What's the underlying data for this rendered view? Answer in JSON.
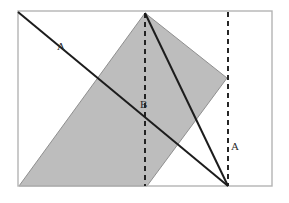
{
  "figure": {
    "canvas": {
      "width": 289,
      "height": 203
    },
    "colors": {
      "background": "#ffffff",
      "frame_stroke": "#b4b4b4",
      "shaded_fill": "#b9b9b9",
      "shaded_stroke": "#8f8f8f",
      "solid_line": "#1c1c1c",
      "dashed_line": "#1c1c1c",
      "label_text": "#2b2b2b"
    },
    "frame": {
      "name": "outer-rectangle",
      "x": 18,
      "y": 11,
      "width": 254,
      "height": 175,
      "stroke_width": 1.4
    },
    "shaded_region": {
      "name": "shaded-parallelogram",
      "points": "145,13 227,78 147,186 19,186",
      "fill_opacity": 0.95,
      "stroke_width": 1.0
    },
    "solid_lines": [
      {
        "name": "diagonal-line-a",
        "x1": 18,
        "y1": 12,
        "x2": 228,
        "y2": 186,
        "stroke_width": 2.0
      },
      {
        "name": "diagonal-line-apex",
        "x1": 145,
        "y1": 13,
        "x2": 228,
        "y2": 186,
        "stroke_width": 2.0
      }
    ],
    "dashed_lines": [
      {
        "name": "dashed-vertical-b",
        "x1": 145,
        "y1": 13,
        "x2": 145,
        "y2": 186,
        "stroke_width": 1.9,
        "dash_pattern": "5,4"
      },
      {
        "name": "dashed-vertical-a",
        "x1": 228,
        "y1": 12,
        "x2": 228,
        "y2": 186,
        "stroke_width": 1.9,
        "dash_pattern": "5,4"
      }
    ],
    "labels": [
      {
        "name": "label-a-upper-left",
        "text": "A",
        "x": 57,
        "y": 50,
        "font_size": 11
      },
      {
        "name": "label-b-center",
        "text": "B",
        "x": 140,
        "y": 108,
        "font_size": 11
      },
      {
        "name": "label-a-right",
        "text": "A",
        "x": 231,
        "y": 150,
        "font_size": 11
      }
    ]
  }
}
